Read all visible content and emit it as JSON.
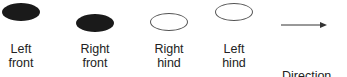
{
  "footprints": [
    {
      "id": "left-front",
      "line1": "Left",
      "line2": "front",
      "fill": "filled"
    },
    {
      "id": "right-front",
      "line1": "Right",
      "line2": "front",
      "fill": "filled"
    },
    {
      "id": "right-hind",
      "line1": "Right",
      "line2": "hind",
      "fill": "hollow"
    },
    {
      "id": "left-hind",
      "line1": "Left",
      "line2": "hind",
      "fill": "hollow"
    }
  ],
  "arrow": {
    "caption": "Direction"
  }
}
